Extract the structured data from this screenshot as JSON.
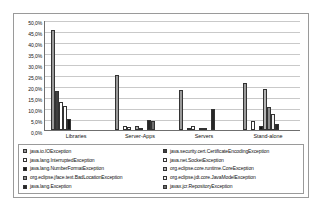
{
  "chart_data": {
    "type": "bar",
    "title": "",
    "xlabel": "",
    "ylabel": "",
    "ylim": [
      0,
      50
    ],
    "grid": true,
    "legend_position": "bottom",
    "categories": [
      "Libraries",
      "Server-Apps",
      "Servers",
      "Stand-alone"
    ],
    "ytick_labels": [
      "50,0%",
      "45,0%",
      "40,0%",
      "35,0%",
      "30,0%",
      "25,0%",
      "20,0%",
      "15,0%",
      "10,0%",
      "5,0%",
      "0,0%"
    ],
    "ytick_values": [
      50,
      45,
      40,
      35,
      30,
      25,
      20,
      15,
      10,
      5,
      0
    ],
    "series": [
      {
        "name": "java.io.IOException",
        "color": "#9a9a9a",
        "values": [
          45.5,
          25.0,
          18.3,
          21.5
        ]
      },
      {
        "name": "java.security.cert.CertificateEncodingException",
        "color": "#3f3f3f",
        "values": [
          17.9,
          0.0,
          0.0,
          0.0
        ]
      },
      {
        "name": "java.lang.InterruptedException",
        "color": "#ffffff",
        "values": [
          12.9,
          1.6,
          1.0,
          4.0
        ]
      },
      {
        "name": "java.net.SocketException",
        "color": "#fdfdfd",
        "values": [
          10.9,
          1.5,
          1.6,
          0.0
        ]
      },
      {
        "name": "java.lang.NumberFormatException",
        "color": "#151515",
        "values": [
          4.8,
          0.0,
          0.0,
          1.7
        ]
      },
      {
        "name": "org.eclipse.core.runtime.CoreException",
        "color": "#b4b4b4",
        "values": [
          0.0,
          1.7,
          0.6,
          18.5
        ]
      },
      {
        "name": "org.eclipse.jface.text.BadLocationException",
        "color": "#8e8e8e",
        "values": [
          0.0,
          0.5,
          0.7,
          10.4
        ]
      },
      {
        "name": "org.eclipse.jdt.core.JavaModelException",
        "color": "#efefef",
        "values": [
          0.0,
          0.0,
          0.0,
          7.1
        ]
      },
      {
        "name": "java.lang.Exception",
        "color": "#262626",
        "values": [
          0.0,
          4.4,
          9.7,
          2.7
        ]
      },
      {
        "name": "javax.jcr.RepositoryException",
        "color": "#6e6e6e",
        "values": [
          0.0,
          3.9,
          0.0,
          0.0
        ]
      }
    ],
    "legend": {
      "left_column": [
        "java.io.IOException",
        "java.lang.InterruptedException",
        "java.lang.NumberFormatException",
        "org.eclipse.jface.text.BadLocationException",
        "java.lang.Exception"
      ],
      "right_column": [
        "java.security.cert.CertificateEncodingException",
        "java.net.SocketException",
        "org.eclipse.core.runtime.CoreException",
        "org.eclipse.jdt.core.JavaModelException",
        "javax.jcr.RepositoryException"
      ]
    }
  }
}
